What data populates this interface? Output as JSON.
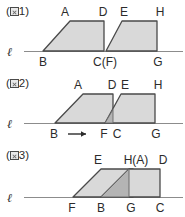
{
  "sheet": {
    "title": "Three figures of trapezoids overlapping on line l",
    "background_color": "#ffffff",
    "ink_color": "#4a4a4a",
    "fill_light": "#d9d9d9",
    "fill_dark": "#b4b4b4"
  },
  "panels": [
    {
      "caption_open": "(",
      "caption_glyph": "図",
      "caption_number": "1",
      "caption_close": ")",
      "line_symbol": "ℓ",
      "motion_arrow": "",
      "labels": {
        "top": [
          "A",
          "D",
          "E",
          "H"
        ],
        "bottom": [
          "B",
          "C(F)",
          "G"
        ]
      }
    },
    {
      "caption_open": "(",
      "caption_glyph": "図",
      "caption_number": "2",
      "caption_close": ")",
      "line_symbol": "ℓ",
      "motion_arrow": "→",
      "labels": {
        "top": [
          "A",
          "D",
          "E",
          "H"
        ],
        "bottom": [
          "B",
          "F",
          "C",
          "G"
        ]
      }
    },
    {
      "caption_open": "(",
      "caption_glyph": "図",
      "caption_number": "3",
      "caption_close": ")",
      "line_symbol": "ℓ",
      "motion_arrow": "",
      "labels": {
        "top": [
          "E",
          "H(A)",
          "D"
        ],
        "bottom": [
          "F",
          "B",
          "G",
          "C"
        ]
      }
    }
  ],
  "panel_1": {
    "caption_open": "(",
    "caption_glyph": "図",
    "caption_number": "1",
    "caption_close": ")",
    "line_symbol": "ℓ",
    "label_A": "A",
    "label_D": "D",
    "label_E": "E",
    "label_H": "H",
    "label_B": "B",
    "label_CF": "C(F)",
    "label_G": "G"
  },
  "panel_2": {
    "caption_open": "(",
    "caption_glyph": "図",
    "caption_number": "2",
    "caption_close": ")",
    "line_symbol": "ℓ",
    "label_A": "A",
    "label_D": "D",
    "label_E": "E",
    "label_H": "H",
    "label_B": "B",
    "label_F": "F",
    "label_C": "C",
    "label_G": "G",
    "arrow": "→"
  },
  "panel_3": {
    "caption_open": "(",
    "caption_glyph": "図",
    "caption_number": "3",
    "caption_close": ")",
    "line_symbol": "ℓ",
    "label_E": "E",
    "label_HA": "H(A)",
    "label_D": "D",
    "label_F": "F",
    "label_B": "B",
    "label_G": "G",
    "label_C": "C"
  }
}
